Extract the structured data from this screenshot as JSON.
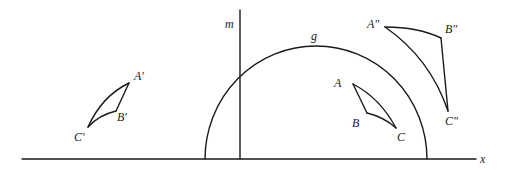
{
  "figure": {
    "labels": {
      "axis": "x",
      "line": "m",
      "semicircle": "g",
      "original": {
        "a": "A",
        "b": "B",
        "c": "C"
      },
      "reflected": {
        "a": "A′",
        "b": "B′",
        "c": "C′"
      },
      "inverted": {
        "a": "A″",
        "b": "B″",
        "c": "C″"
      }
    },
    "colors": {
      "ink": "#1a1a1a",
      "background": "#ffffff"
    }
  }
}
